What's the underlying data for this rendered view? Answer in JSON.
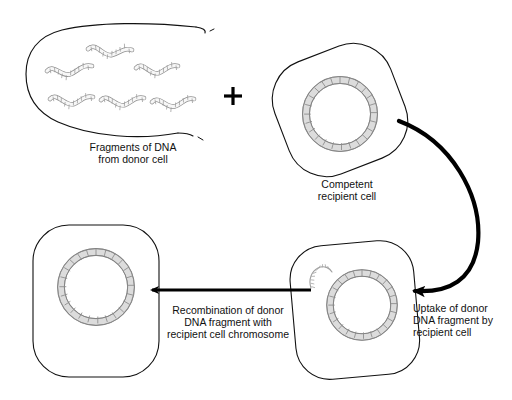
{
  "diagram": {
    "background_color": "#ffffff",
    "outline_color": "#000000",
    "chromosome_fill": "#d9d9d9",
    "chromosome_stroke": "#7a7a7a",
    "fragment_fill": "#f2f2f2",
    "fragment_stroke": "#8c8c8c",
    "arrow_color": "#000000"
  },
  "labels": {
    "plus_sign": "+",
    "donor_fragments": "Fragments of DNA\nfrom donor cell",
    "competent_cell": "Competent\nrecipient cell",
    "uptake": "Uptake of donor\nDNA fragment by\nrecipient cell",
    "recombination": "Recombination of donor\nDNA fragment with\nrecipient cell chromosome"
  },
  "elements": {
    "donor_cell": {
      "name": "ruptured donor cell",
      "state": "lysed / open membrane",
      "fragment_count": 6
    },
    "competent_cell": {
      "name": "competent recipient cell",
      "has_chromosome": true,
      "has_free_fragment": false
    },
    "uptake_cell": {
      "name": "recipient cell after uptake",
      "has_chromosome": true,
      "has_free_fragment": true
    },
    "recombinant_cell": {
      "name": "recombinant recipient cell",
      "has_chromosome": true,
      "has_free_fragment": false
    },
    "curved_arrow": {
      "name": "uptake arrow",
      "direction": "clockwise, points left"
    },
    "straight_arrow": {
      "name": "recombination arrow",
      "direction": "points left"
    }
  }
}
